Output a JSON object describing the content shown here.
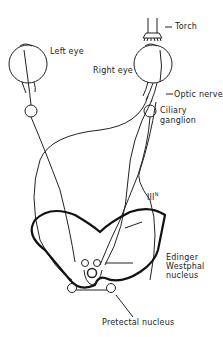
{
  "diagram": {
    "type": "pupillary light reflex pathway",
    "labels": {
      "torch": "Torch",
      "left_eye": "Left eye",
      "right_eye": "Right eye",
      "optic_nerve": "Optic nerve",
      "ciliary_ganglion_1": "Ciliary",
      "ciliary_ganglion_2": "ganglion",
      "third_nerve": "III",
      "third_nerve_sup": "N",
      "edinger_1": "Edinger",
      "edinger_2": "Westphal",
      "edinger_3": "nucleus",
      "pretectal": "Pretectal nucleus"
    },
    "colors": {
      "line": "#222222",
      "background": "#ffffff"
    }
  }
}
